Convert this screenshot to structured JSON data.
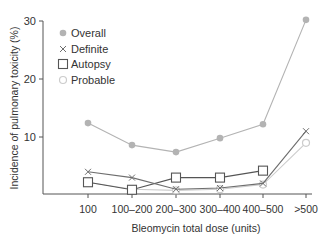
{
  "chart_data": {
    "type": "line",
    "title": "",
    "xlabel": "Bleomycin total dose (units)",
    "ylabel": "Incidence of pulmonary toxicity (%)",
    "categories": [
      "100",
      "100–200",
      "200–300",
      "300–400",
      "400–500",
      ">500"
    ],
    "yticks": [
      10,
      20,
      30
    ],
    "ylim": [
      0,
      30
    ],
    "grid": false,
    "legend_position": "upper left",
    "series": [
      {
        "name": "Overall",
        "marker": "filled-circle",
        "color": "#b3b3b3",
        "values": [
          12.4,
          8.6,
          7.4,
          9.8,
          12.2,
          30.2
        ]
      },
      {
        "name": "Definite",
        "marker": "x",
        "color": "#6e6e6e",
        "values": [
          4.0,
          3.0,
          1.0,
          1.2,
          2.0,
          11.0
        ]
      },
      {
        "name": "Autopsy",
        "marker": "open-square",
        "color": "#555555",
        "values": [
          2.2,
          0.9,
          3.0,
          3.0,
          4.2,
          null
        ]
      },
      {
        "name": "Probable",
        "marker": "open-circle",
        "color": "#cccccc",
        "values": [
          2.2,
          1.0,
          0.8,
          1.0,
          1.8,
          9.0
        ]
      }
    ]
  }
}
